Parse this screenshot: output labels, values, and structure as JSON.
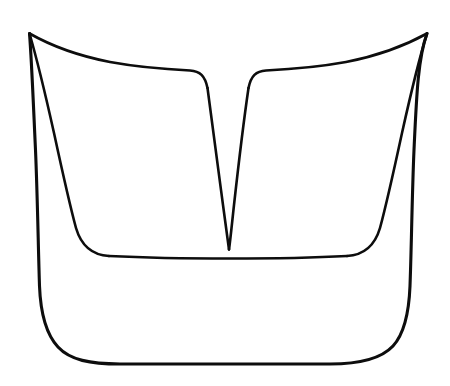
{
  "figure": {
    "title": "Vessel outline line drawing",
    "medium": "ink line drawing",
    "background_color": "#ffffff",
    "line_color": "#0d0d0d",
    "canvas": {
      "width": 450,
      "height": 386
    },
    "strokes": [
      {
        "name": "outer-contour",
        "role": "outer silhouette of the vessel",
        "stroke_width": 3.1,
        "closed": false,
        "path": "M 29.5 33.5 C 31.5 58 33.0 96 35.5 150 C 37.5 196 38.2 246 39.5 286 C 40.5 312 45.0 333 58.0 347 C 70.0 360 90.0 364 120.0 364 L 330.0 364 C 360.0 364 381.0 359 393.0 346 C 405.0 333 409.0 312 410.0 286 C 411.5 246 412.0 196 414.0 150 C 416.5 96 418.0 58 427.0 33.5"
      },
      {
        "name": "inner-contour-left",
        "role": "left inner contour from top horn tip down to inner basin",
        "stroke_width": 2.6,
        "closed": false,
        "path": "M 29.5 33.5 C 36.0 56 44.0 88 54.0 133 C 62.0 170 70.0 206 76.0 228 C 81.0 245 91.0 255 109.0 256"
      },
      {
        "name": "inner-contour-right",
        "role": "right inner contour from top horn tip down to inner basin",
        "stroke_width": 2.6,
        "closed": false,
        "path": "M 427.0 33.5 C 420.0 56 412.0 88 402.0 133 C 394.0 170 386.0 206 380.0 228 C 375.0 245 365.0 255 347.0 256"
      },
      {
        "name": "inner-basin-floor",
        "role": "slightly bowed horizontal floor line of the inner basin",
        "stroke_width": 2.6,
        "closed": false,
        "path": "M 109.0 256 C 150.0 258 200.0 258.5 229.0 258.5 C 260.0 258.5 310.0 258 347.0 256"
      },
      {
        "name": "upper-rim-left",
        "role": "left upper rim sweeping from horn tip across to the V notch shoulder",
        "stroke_width": 2.6,
        "closed": false,
        "path": "M 29.5 33.5 C 48.0 44 74.0 55 110.0 62 C 140.0 67.5 170.0 69.5 190.0 70.5 C 200.0 71.0 205.0 76.0 207.5 88.0"
      },
      {
        "name": "upper-rim-right",
        "role": "right upper rim sweeping from horn tip across to the V notch shoulder",
        "stroke_width": 2.6,
        "closed": false,
        "path": "M 427.0 33.5 C 408.0 44 382.0 55 346.0 62 C 316.0 67.5 286.0 69.5 266.0 70.5 C 256.0 71.0 251.0 76.0 248.5 88.0"
      },
      {
        "name": "notch-left-edge",
        "role": "left edge of the central V notch descending to the apex",
        "stroke_width": 2.6,
        "closed": false,
        "path": "M 207.5 88.0 C 211.0 112 217.0 160 223.0 205 C 226.0 228 228.0 243 229.0 249.5"
      },
      {
        "name": "notch-right-edge",
        "role": "right edge of the central V notch descending to the apex",
        "stroke_width": 2.6,
        "closed": false,
        "path": "M 248.5 88.0 C 245.0 112 239.0 160 234.0 205 C 231.5 228 230.0 243 229.0 249.5"
      }
    ],
    "key_points": {
      "left_horn_tip": {
        "x": 29.5,
        "y": 33.5
      },
      "right_horn_tip": {
        "x": 427.0,
        "y": 33.5
      },
      "notch_apex": {
        "x": 229.0,
        "y": 249.5
      },
      "notch_shoulder_left": {
        "x": 207.5,
        "y": 88.0
      },
      "notch_shoulder_right": {
        "x": 248.5,
        "y": 88.0
      },
      "basin_floor_y": 257,
      "bottom_edge_y": 364,
      "outer_left_x_at_bottom": 39.5,
      "outer_right_x_at_bottom": 410.0
    }
  }
}
